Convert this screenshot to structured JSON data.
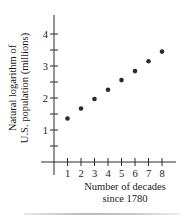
{
  "chart_data": {
    "type": "scatter",
    "title": "",
    "xlabel": "Number of decades since 1780",
    "xlabel_lines": [
      "Number of decades",
      "since 1780"
    ],
    "ylabel": "Natural logarithm of U.S. population (millions)",
    "ylabel_lines": [
      "Natural logarithm of",
      "U.S. population (millions)"
    ],
    "x": [
      1,
      2,
      3,
      4,
      5,
      6,
      7,
      8
    ],
    "y": [
      1.36,
      1.67,
      1.97,
      2.26,
      2.56,
      2.84,
      3.15,
      3.45
    ],
    "x_ticks": [
      "1",
      "2",
      "3",
      "4",
      "5",
      "6",
      "7",
      "8"
    ],
    "y_ticks": [
      "1",
      "2",
      "3",
      "4"
    ],
    "y_minor_ticks": [
      0.5,
      1.5,
      2.5,
      3.5
    ],
    "xlim": [
      -1,
      9
    ],
    "ylim": [
      0,
      4.5
    ],
    "grid": false,
    "legend": null,
    "marker_color": "#2a2a2a"
  }
}
